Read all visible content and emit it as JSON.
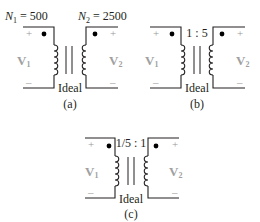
{
  "colors": {
    "line": "#231f20",
    "dot": "#000000",
    "polarity_sign": "#9a9a9a",
    "voltage_label": "#a0a0a0"
  },
  "panels": [
    {
      "id": "a",
      "caption": "(a)",
      "core_label": "Ideal",
      "top_left_label": {
        "main": "N",
        "sub": "1",
        "rest": " = 500"
      },
      "top_right_label": {
        "main": "N",
        "sub": "2",
        "rest": " = 2500"
      },
      "ratio": "",
      "primary": {
        "voltage": "V",
        "voltage_sub": "1",
        "plus": "+",
        "minus": "–"
      },
      "secondary": {
        "voltage": "V",
        "voltage_sub": "2",
        "plus": "+",
        "minus": "–"
      }
    },
    {
      "id": "b",
      "caption": "(b)",
      "core_label": "Ideal",
      "ratio": "1 : 5",
      "primary": {
        "voltage": "V",
        "voltage_sub": "1",
        "plus": "+",
        "minus": "–"
      },
      "secondary": {
        "voltage": "V",
        "voltage_sub": "2",
        "plus": "+",
        "minus": "–"
      }
    },
    {
      "id": "c",
      "caption": "(c)",
      "core_label": "Ideal",
      "ratio": "1/5 : 1",
      "primary": {
        "voltage": "V",
        "voltage_sub": "1",
        "plus": "+",
        "minus": "–"
      },
      "secondary": {
        "voltage": "V",
        "voltage_sub": "2",
        "plus": "+",
        "minus": "–"
      }
    }
  ]
}
